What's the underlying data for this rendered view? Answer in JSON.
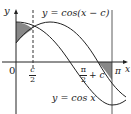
{
  "figure": {
    "curve1_label": "y = cos(x − c)",
    "curve2_label": "y = cos x",
    "y_axis_label": "y",
    "x_axis_label": "x",
    "origin_label": "0",
    "tick_c_half": {
      "num": "c",
      "den": "2"
    },
    "tick_pi_half_plus_c": {
      "num": "π",
      "den": "2",
      "suffix": "+ c"
    },
    "tick_pi": "π",
    "colors": {
      "line": "#222222",
      "shade": "#888888",
      "background": "#ffffff"
    }
  }
}
